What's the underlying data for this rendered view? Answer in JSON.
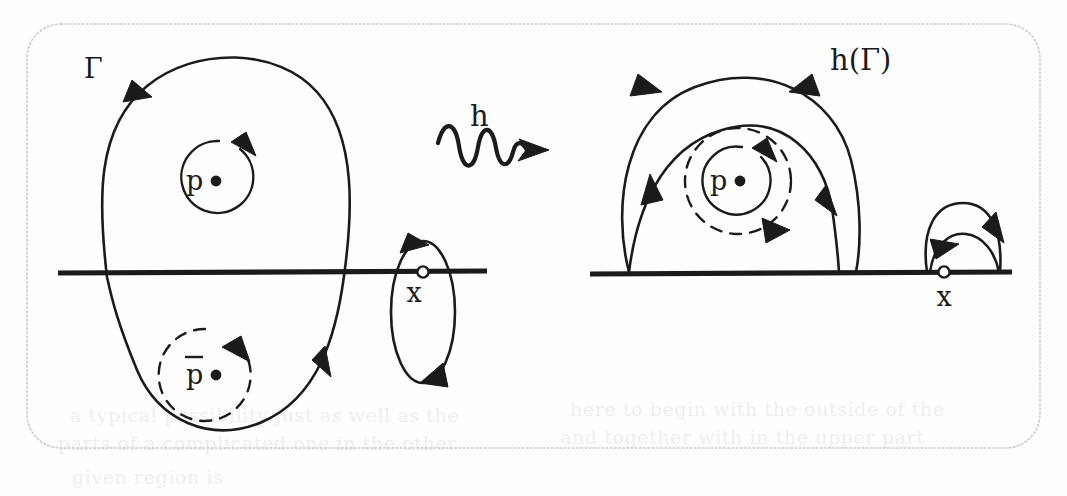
{
  "figure": {
    "kind": "mathematical-diagram",
    "background_color": "#fefefe",
    "ink_color": "#1b1b1b",
    "border_color": "#c9c9c9"
  },
  "left_panel": {
    "gamma_label": "Γ",
    "p_label": "p",
    "pbar_label": "p̅",
    "pbar_base": "p",
    "x_label": "x",
    "real_axis_name": "horizontal-real-axis"
  },
  "map_arrow": {
    "label": "h",
    "style": "squiggly-arrow"
  },
  "right_panel": {
    "image_label": "h(Γ)",
    "p_label": "p",
    "x_label": "x",
    "real_axis_name": "horizontal-real-axis"
  },
  "ghost_text": {
    "line1": "a typical possibility just as well as the",
    "line2": "parts of a complicated one in the other",
    "line3": "here to begin with the outside of the",
    "line4": "and together with in the upper part",
    "line5": "given region is"
  }
}
